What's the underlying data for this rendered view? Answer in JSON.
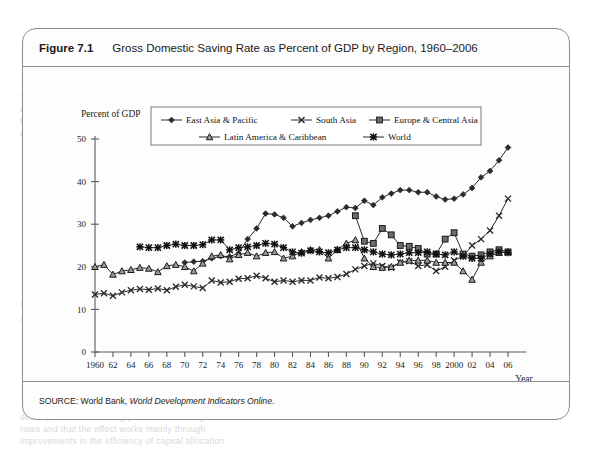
{
  "figure": {
    "number": "Figure 7.1",
    "title": "Gross Domestic Saving Rate as Percent of GDP by Region, 1960–2006",
    "source_prefix": "SOURCE: World Bank, ",
    "source_italic": "World Development Indicators Online",
    "source_suffix": "."
  },
  "chart_data": {
    "type": "line",
    "title": "Gross Domestic Saving Rate as Percent of GDP by Region, 1960–2006",
    "xlabel": "Year",
    "ylabel": "Percent of GDP",
    "xlim": [
      1960,
      2006
    ],
    "ylim": [
      0,
      50
    ],
    "yticks": [
      0,
      10,
      20,
      30,
      40,
      50
    ],
    "xticks": [
      1960,
      1962,
      1964,
      1966,
      1968,
      1970,
      1972,
      1974,
      1976,
      1978,
      1980,
      1982,
      1984,
      1986,
      1988,
      1990,
      1992,
      1994,
      1996,
      1998,
      2000,
      2002,
      2004,
      2006
    ],
    "xticklabels": [
      "1960",
      "62",
      "64",
      "66",
      "68",
      "70",
      "72",
      "74",
      "76",
      "78",
      "80",
      "82",
      "84",
      "86",
      "88",
      "90",
      "92",
      "94",
      "96",
      "98",
      "2000",
      "02",
      "04",
      "06"
    ],
    "grid": false,
    "legend_position": "upper center",
    "x": [
      1960,
      1961,
      1962,
      1963,
      1964,
      1965,
      1966,
      1967,
      1968,
      1969,
      1970,
      1971,
      1972,
      1973,
      1974,
      1975,
      1976,
      1977,
      1978,
      1979,
      1980,
      1981,
      1982,
      1983,
      1984,
      1985,
      1986,
      1987,
      1988,
      1989,
      1990,
      1991,
      1992,
      1993,
      1994,
      1995,
      1996,
      1997,
      1998,
      1999,
      2000,
      2001,
      2002,
      2003,
      2004,
      2005,
      2006
    ],
    "series": [
      {
        "name": "East Asia & Pacific",
        "marker": "diamond",
        "start_year": 1970,
        "values": [
          null,
          null,
          null,
          null,
          null,
          null,
          null,
          null,
          null,
          null,
          21.0,
          21.2,
          21.3,
          22.0,
          22.5,
          22.4,
          23.2,
          26.5,
          29.0,
          32.5,
          32.3,
          31.5,
          29.5,
          30.3,
          31.0,
          31.5,
          32.0,
          33.0,
          34.0,
          33.8,
          35.5,
          34.5,
          36.3,
          37.2,
          38.0,
          38.0,
          37.5,
          37.5,
          36.5,
          35.8,
          36.0,
          37.0,
          38.5,
          41.0,
          42.5,
          45.0,
          48.0
        ]
      },
      {
        "name": "South Asia",
        "marker": "x",
        "start_year": 1960,
        "values": [
          13.5,
          13.8,
          13.2,
          14.0,
          14.5,
          14.8,
          14.6,
          14.9,
          14.5,
          15.3,
          15.8,
          15.4,
          15.0,
          16.8,
          16.3,
          16.5,
          17.2,
          17.3,
          17.9,
          17.3,
          16.5,
          16.8,
          16.5,
          16.8,
          16.8,
          17.5,
          17.3,
          17.6,
          18.3,
          19.4,
          20.2,
          20.8,
          20.2,
          19.8,
          21.0,
          21.3,
          20.2,
          20.5,
          19.0,
          20.0,
          21.5,
          22.5,
          25.0,
          26.5,
          28.5,
          32.0,
          36.0
        ]
      },
      {
        "name": "Europe & Central Asia",
        "marker": "square",
        "start_year": 1989,
        "values": [
          null,
          null,
          null,
          null,
          null,
          null,
          null,
          null,
          null,
          null,
          null,
          null,
          null,
          null,
          null,
          null,
          null,
          null,
          null,
          null,
          null,
          null,
          null,
          null,
          null,
          null,
          null,
          null,
          null,
          32.0,
          26.0,
          25.5,
          29.0,
          27.5,
          25.0,
          24.8,
          24.3,
          23.0,
          23.0,
          26.5,
          28.0,
          23.0,
          22.5,
          22.8,
          23.5,
          24.0,
          23.5
        ]
      },
      {
        "name": "Latin America & Caribbean",
        "marker": "triangle",
        "start_year": 1960,
        "values": [
          20.0,
          20.5,
          18.2,
          19.0,
          19.3,
          19.8,
          19.6,
          18.8,
          20.2,
          20.5,
          20.0,
          19.0,
          20.8,
          22.5,
          22.8,
          21.8,
          22.8,
          23.3,
          22.5,
          23.3,
          23.5,
          22.0,
          22.5,
          23.5,
          24.0,
          24.0,
          22.0,
          24.0,
          25.5,
          26.3,
          22.0,
          20.0,
          19.8,
          20.0,
          21.0,
          21.5,
          21.5,
          21.5,
          21.0,
          21.0,
          21.0,
          19.0,
          17.0,
          21.0,
          22.5,
          23.3,
          23.5
        ]
      },
      {
        "name": "World",
        "marker": "asterisk",
        "start_year": 1965,
        "values": [
          null,
          null,
          null,
          null,
          null,
          24.7,
          24.5,
          24.5,
          25.0,
          25.3,
          25.0,
          25.0,
          25.2,
          26.3,
          26.3,
          24.0,
          24.5,
          24.7,
          25.0,
          25.5,
          25.3,
          24.5,
          23.5,
          23.2,
          23.8,
          23.5,
          23.3,
          24.0,
          24.5,
          24.5,
          24.0,
          23.5,
          23.0,
          22.8,
          23.0,
          23.3,
          23.3,
          23.5,
          23.0,
          22.8,
          23.5,
          22.5,
          22.0,
          22.0,
          23.0,
          23.5,
          23.3
        ]
      }
    ],
    "legend": [
      {
        "label": "East Asia & Pacific",
        "marker": "diamond"
      },
      {
        "label": "South Asia",
        "marker": "x"
      },
      {
        "label": "Europe & Central Asia",
        "marker": "square"
      },
      {
        "label": "Latin America & Caribbean",
        "marker": "triangle"
      },
      {
        "label": "World",
        "marker": "asterisk"
      }
    ],
    "colors": {
      "line": "#2a2a2a",
      "axis": "#5b5b5b",
      "background": "#fdfdfd"
    }
  },
  "bleed_text": [
    {
      "t": "TYPES OF TAXES",
      "x": 488,
      "y": 92
    },
    {
      "t": "Taxes come in many forms and are levied on many",
      "x": 20,
      "y": 92
    },
    {
      "t": "different bases. They can be broadly grouped into",
      "x": 20,
      "y": 104
    },
    {
      "t": "the following categories of taxation used widely",
      "x": 20,
      "y": 116
    },
    {
      "t": "across countries and regions of the world today.",
      "x": 20,
      "y": 128
    },
    {
      "t": "indirect taxes on goods and services, and trade",
      "x": 488,
      "y": 128
    },
    {
      "t": "taxes. The relative importance of these varies",
      "x": 488,
      "y": 142
    },
    {
      "t": "considerably across countries and over time",
      "x": 488,
      "y": 156
    },
    {
      "t": "SOURCE OF FINANCIAL ORGANIZATION AND STABILITY",
      "x": 20,
      "y": 300
    },
    {
      "t": "A growing body of research finds that financial",
      "x": 20,
      "y": 314
    },
    {
      "t": "development has a strong positive effect on growth",
      "x": 20,
      "y": 412
    },
    {
      "t": "rates and that the effect works mainly through",
      "x": 20,
      "y": 424
    },
    {
      "t": "improvements in the efficiency of capital allocation",
      "x": 20,
      "y": 436
    }
  ]
}
